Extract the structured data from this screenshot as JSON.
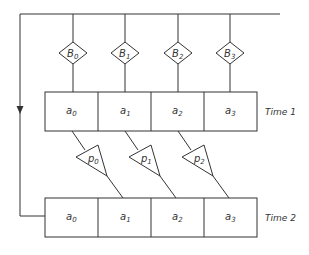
{
  "diagram": {
    "type": "feedback-register-diagram",
    "top_row_label": "Time 1",
    "bottom_row_label": "Time 2",
    "top_cells": [
      {
        "base": "a",
        "sub": "0"
      },
      {
        "base": "a",
        "sub": "1"
      },
      {
        "base": "a",
        "sub": "2"
      },
      {
        "base": "a",
        "sub": "3"
      }
    ],
    "bottom_cells": [
      {
        "base": "a",
        "sub": "0"
      },
      {
        "base": "a",
        "sub": "1"
      },
      {
        "base": "a",
        "sub": "2"
      },
      {
        "base": "a",
        "sub": "3"
      }
    ],
    "diamonds": [
      {
        "base": "B",
        "sub": "0"
      },
      {
        "base": "B",
        "sub": "1"
      },
      {
        "base": "B",
        "sub": "2"
      },
      {
        "base": "B",
        "sub": "3"
      }
    ],
    "triangles": [
      {
        "base": "p",
        "sub": "0"
      },
      {
        "base": "p",
        "sub": "1"
      },
      {
        "base": "p",
        "sub": "2"
      }
    ],
    "feedback_arrow": "down",
    "line_color": "#333333",
    "background": "#ffffff"
  }
}
